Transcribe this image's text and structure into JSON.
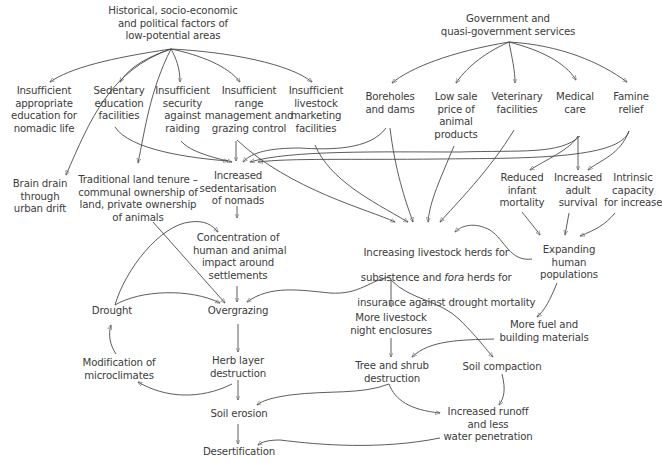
{
  "diagram": {
    "type": "causal-flow",
    "nodes": {
      "historical": "Historical, socio-economic\nand political factors of\nlow-potential areas",
      "government": "Government and\nquasi-government services",
      "insuff_education": "Insufficient\nappropriate\neducation for\nnomadic life",
      "sedentary_education": "Sedentary\neducation\nfacilities",
      "insuff_security": "Insufficient\nsecurity\nagainst\nraiding",
      "insuff_range": "Insufficient\nrange\nmanagement and\ngrazing control",
      "insuff_marketing": "Insufficient\nlivestock\nmarketing\nfacilities",
      "boreholes": "Boreholes\nand dams",
      "low_sale_price": "Low sale\nprice of\nanimal\nproducts",
      "veterinary": "Veterinary\nfacilities",
      "medical": "Medical\ncare",
      "famine": "Famine\nrelief",
      "brain_drain": "Brain drain\nthrough\nurban drift",
      "land_tenure": "Traditional land tenure –\ncommunal ownership of\nland, private ownership\nof animals",
      "sedentarisation": "Increased\nsedentarisation\nof nomads",
      "infant_mortality": "Reduced\ninfant\nmortality",
      "adult_survival": "Increased\nadult\nsurvival",
      "intrinsic": "Intrinsic\ncapacity\nfor increase",
      "concentration": "Concentration of\nhuman and animal\nimpact around\nsettlements",
      "herds_line1": "Increasing livestock herds for",
      "herds_line2a": "subsistence and ",
      "herds_line2b": "fora",
      "herds_line2c": " herds for",
      "herds_line3": "insurance against drought mortality",
      "expanding": "Expanding\nhuman\npopulations",
      "drought": "Drought",
      "overgrazing": "Overgrazing",
      "night_enclosures": "More livestock\nnight enclosures",
      "fuel": "More fuel and\nbuilding materials",
      "microclimates": "Modification of\nmicroclimates",
      "herb_layer": "Herb layer\ndestruction",
      "tree_shrub": "Tree and shrub\ndestruction",
      "soil_compaction": "Soil compaction",
      "soil_erosion": "Soil erosion",
      "runoff": "Increased runoff\nand less\nwater penetration",
      "desertification": "Desertification"
    },
    "edges": [
      [
        "historical",
        "insuff_education"
      ],
      [
        "historical",
        "sedentary_education"
      ],
      [
        "historical",
        "insuff_security"
      ],
      [
        "historical",
        "insuff_range"
      ],
      [
        "historical",
        "insuff_marketing"
      ],
      [
        "historical",
        "brain_drain"
      ],
      [
        "historical",
        "land_tenure"
      ],
      [
        "government",
        "boreholes"
      ],
      [
        "government",
        "low_sale_price"
      ],
      [
        "government",
        "veterinary"
      ],
      [
        "government",
        "medical"
      ],
      [
        "government",
        "famine"
      ],
      [
        "sedentary_education",
        "sedentarisation"
      ],
      [
        "insuff_security",
        "sedentarisation"
      ],
      [
        "insuff_range",
        "sedentarisation"
      ],
      [
        "insuff_range",
        "herds"
      ],
      [
        "boreholes",
        "sedentarisation"
      ],
      [
        "medical",
        "sedentarisation"
      ],
      [
        "famine",
        "sedentarisation"
      ],
      [
        "insuff_marketing",
        "herds"
      ],
      [
        "boreholes",
        "herds"
      ],
      [
        "low_sale_price",
        "herds"
      ],
      [
        "veterinary",
        "herds"
      ],
      [
        "medical",
        "infant_mortality"
      ],
      [
        "medical",
        "adult_survival"
      ],
      [
        "famine",
        "adult_survival"
      ],
      [
        "infant_mortality",
        "expanding"
      ],
      [
        "adult_survival",
        "expanding"
      ],
      [
        "intrinsic",
        "expanding"
      ],
      [
        "expanding",
        "herds"
      ],
      [
        "expanding",
        "fuel"
      ],
      [
        "sedentarisation",
        "concentration"
      ],
      [
        "drought",
        "concentration"
      ],
      [
        "land_tenure",
        "overgrazing"
      ],
      [
        "concentration",
        "overgrazing"
      ],
      [
        "drought",
        "overgrazing"
      ],
      [
        "herds",
        "overgrazing"
      ],
      [
        "herds",
        "night_enclosures"
      ],
      [
        "herds",
        "soil_compaction"
      ],
      [
        "overgrazing",
        "herb_layer"
      ],
      [
        "herb_layer",
        "microclimates"
      ],
      [
        "microclimates",
        "drought"
      ],
      [
        "herb_layer",
        "soil_erosion"
      ],
      [
        "tree_shrub",
        "soil_erosion"
      ],
      [
        "night_enclosures",
        "tree_shrub"
      ],
      [
        "fuel",
        "tree_shrub"
      ],
      [
        "tree_shrub",
        "runoff"
      ],
      [
        "soil_compaction",
        "runoff"
      ],
      [
        "soil_erosion",
        "desertification"
      ],
      [
        "runoff",
        "desertification"
      ]
    ],
    "colors": {
      "text": "#3c3c3c",
      "line": "#4a4a4a",
      "background": "#ffffff"
    }
  }
}
